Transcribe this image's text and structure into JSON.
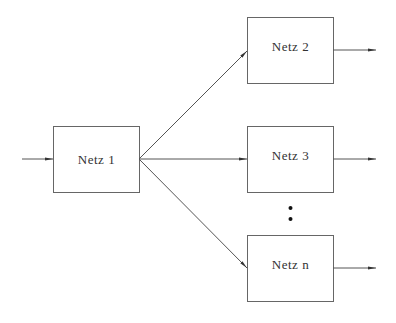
{
  "diagram": {
    "type": "block-diagram",
    "colors": {
      "line": "#555555",
      "text": "#333333",
      "background": "#ffffff"
    },
    "nodes": [
      {
        "id": "netz1",
        "label": "Netz 1"
      },
      {
        "id": "netz2",
        "label": "Netz 2"
      },
      {
        "id": "netz3",
        "label": "Netz 3"
      },
      {
        "id": "netzn",
        "label": "Netz n"
      }
    ],
    "edges": [
      {
        "from": "input",
        "to": "netz1"
      },
      {
        "from": "netz1",
        "to": "netz2"
      },
      {
        "from": "netz1",
        "to": "netz3"
      },
      {
        "from": "netz1",
        "to": "netzn"
      },
      {
        "from": "netz2",
        "to": "output"
      },
      {
        "from": "netz3",
        "to": "output"
      },
      {
        "from": "netzn",
        "to": "output"
      }
    ],
    "ellipsis": "vertical dots between Netz 3 and Netz n"
  }
}
